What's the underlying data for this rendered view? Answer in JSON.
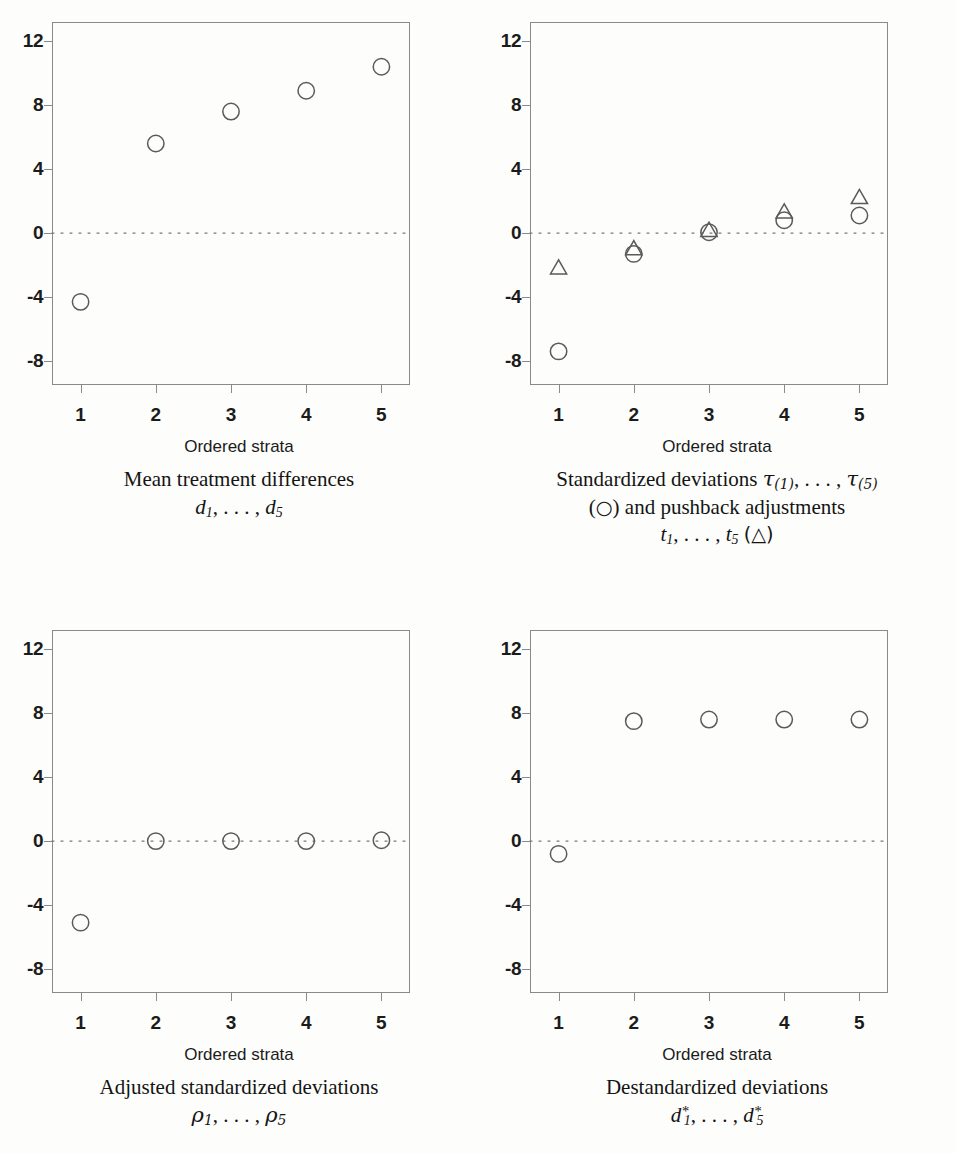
{
  "figure": {
    "axis_title": "Ordered strata",
    "marker_colors": {
      "stroke": "#5a5a5a",
      "frame": "#8a8a8a",
      "text": "#1b1b1b"
    }
  },
  "axes": {
    "y_ticks": [
      "12",
      "8",
      "4",
      "0",
      "-4",
      "-8"
    ],
    "y_values": [
      12,
      8,
      4,
      0,
      -4,
      -8
    ],
    "x_ticks": [
      "1",
      "2",
      "3",
      "4",
      "5"
    ],
    "x_values": [
      1,
      2,
      3,
      4,
      5
    ],
    "ylim": [
      -9.5,
      13.2
    ],
    "xlim": [
      0.62,
      5.38
    ]
  },
  "panels": [
    {
      "id": "mean-treatment-differences",
      "caption_main": "Mean treatment differences",
      "caption_sym_prefix": "d",
      "caption_sym_sub1": "1",
      "caption_sym_mid": ", . . . ,",
      "caption_sym_prefix2": "d",
      "caption_sym_sub2": "5"
    },
    {
      "id": "standardized-deviations",
      "caption_l1_a": "Standardized deviations",
      "caption_l1_tau": "τ",
      "caption_l1_sub1": "(1)",
      "caption_l1_mid": ", . . . ,",
      "caption_l1_tau2": "τ",
      "caption_l1_sub2": "(5)",
      "caption_l2_open": "(",
      "caption_l2_circle": "○",
      "caption_l2_close": ") and pushback adjustments",
      "caption_l3_t1": "t",
      "caption_l3_sub1": "1",
      "caption_l3_mid": ", . . . ,",
      "caption_l3_t2": "t",
      "caption_l3_sub2": "5",
      "caption_l3_tri": "(△)"
    },
    {
      "id": "adjusted-standardized-deviations",
      "caption_main": "Adjusted standardized deviations",
      "caption_sym_prefix": "ρ",
      "caption_sym_sub1": "1",
      "caption_sym_mid": ", . . . ,",
      "caption_sym_prefix2": "ρ",
      "caption_sym_sub2": "5"
    },
    {
      "id": "destandardized-deviations",
      "caption_main": "Destandardized deviations",
      "caption_sym_prefix": "d",
      "caption_sym_sub1": "1",
      "caption_sym_star": "*",
      "caption_sym_mid": ", . . . ,",
      "caption_sym_prefix2": "d",
      "caption_sym_sub2": "5",
      "caption_sym_star2": "*"
    }
  ],
  "chart_data": [
    {
      "type": "scatter",
      "title": "Mean treatment differences d_1, ..., d_5",
      "xlabel": "Ordered strata",
      "ylabel": "",
      "categories": [
        1,
        2,
        3,
        4,
        5
      ],
      "xlim": [
        0.62,
        5.38
      ],
      "ylim": [
        -9.5,
        13.2
      ],
      "grid": false,
      "reference_line": {
        "y": 0,
        "style": "dotted"
      },
      "series": [
        {
          "name": "d",
          "marker": "circle",
          "values": [
            -4.3,
            5.6,
            7.6,
            8.9,
            10.4
          ]
        }
      ]
    },
    {
      "type": "scatter",
      "title": "Standardized deviations tau_(1), ..., tau_(5) (circle) and pushback adjustments t_1, ..., t_5 (triangle)",
      "xlabel": "Ordered strata",
      "ylabel": "",
      "categories": [
        1,
        2,
        3,
        4,
        5
      ],
      "xlim": [
        0.62,
        5.38
      ],
      "ylim": [
        -9.5,
        13.2
      ],
      "grid": false,
      "reference_line": {
        "y": 0,
        "style": "dotted"
      },
      "series": [
        {
          "name": "τ (standardized deviations)",
          "marker": "circle",
          "values": [
            -7.4,
            -1.3,
            0.05,
            0.8,
            1.1
          ]
        },
        {
          "name": "t (pushback adjustments)",
          "marker": "triangle",
          "values": [
            -2.2,
            -1.0,
            0.15,
            1.3,
            2.2
          ]
        }
      ]
    },
    {
      "type": "scatter",
      "title": "Adjusted standardized deviations rho_1, ..., rho_5",
      "xlabel": "Ordered strata",
      "ylabel": "",
      "categories": [
        1,
        2,
        3,
        4,
        5
      ],
      "xlim": [
        0.62,
        5.38
      ],
      "ylim": [
        -9.5,
        13.2
      ],
      "grid": false,
      "reference_line": {
        "y": 0,
        "style": "dotted"
      },
      "series": [
        {
          "name": "ρ",
          "marker": "circle",
          "values": [
            -5.1,
            0.0,
            0.0,
            0.0,
            0.05
          ]
        }
      ]
    },
    {
      "type": "scatter",
      "title": "Destandardized deviations d*_1, ..., d*_5",
      "xlabel": "Ordered strata",
      "ylabel": "",
      "categories": [
        1,
        2,
        3,
        4,
        5
      ],
      "xlim": [
        0.62,
        5.38
      ],
      "ylim": [
        -9.5,
        13.2
      ],
      "grid": false,
      "reference_line": {
        "y": 0,
        "style": "dotted"
      },
      "series": [
        {
          "name": "d*",
          "marker": "circle",
          "values": [
            -0.8,
            7.5,
            7.6,
            7.6,
            7.6
          ]
        }
      ]
    }
  ]
}
